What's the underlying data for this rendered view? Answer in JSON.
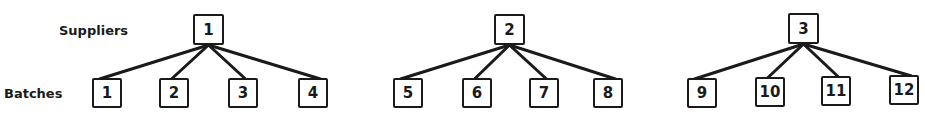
{
  "row_labels": {
    "suppliers": "Suppliers",
    "batches": "Batches"
  },
  "groups": [
    {
      "supplier": "1",
      "batches": [
        "1",
        "2",
        "3",
        "4"
      ]
    },
    {
      "supplier": "2",
      "batches": [
        "5",
        "6",
        "7",
        "8"
      ]
    },
    {
      "supplier": "3",
      "batches": [
        "9",
        "10",
        "11",
        "12"
      ]
    }
  ],
  "colors": {
    "ink": "#1a1a1a",
    "background": "#ffffff"
  }
}
